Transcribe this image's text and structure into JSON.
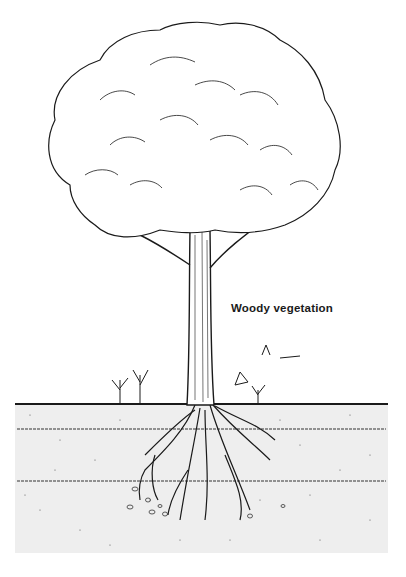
{
  "illustration": {
    "subject": "tree with root system in soil",
    "label": "Woody vegetation",
    "colors": {
      "ink": "#1a1a1a",
      "soil": "#eeeeee",
      "background": "#ffffff"
    }
  }
}
